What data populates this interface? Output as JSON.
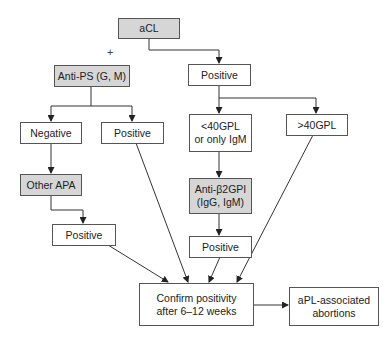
{
  "diagram": {
    "type": "flowchart",
    "nodes": [
      {
        "id": "acl",
        "label": "aCL",
        "shaded": true
      },
      {
        "id": "anti_ps",
        "label": "Anti-PS (G, M)",
        "shaded": true
      },
      {
        "id": "acl_positive",
        "label": "Positive",
        "shaded": false
      },
      {
        "id": "ps_negative",
        "label": "Negative",
        "shaded": false
      },
      {
        "id": "ps_positive",
        "label": "Positive",
        "shaded": false
      },
      {
        "id": "lt40",
        "label": "<40GPL\nor only IgM",
        "shaded": false
      },
      {
        "id": "gt40",
        "label": ">40GPL",
        "shaded": false
      },
      {
        "id": "other_apa",
        "label": "Other APA",
        "shaded": true
      },
      {
        "id": "anti_b2gpi",
        "label": "Anti-β2GPI\n(IgG, IgM)",
        "shaded": true
      },
      {
        "id": "apa_positive",
        "label": "Positive",
        "shaded": false
      },
      {
        "id": "b2gpi_positive",
        "label": "Positive",
        "shaded": false
      },
      {
        "id": "confirm",
        "label": "Confirm positivity\nafter 6–12 weeks",
        "shaded": false
      },
      {
        "id": "apl_abortions",
        "label": "aPL-associated\nabortions",
        "shaded": false
      }
    ],
    "plus_symbol": "+",
    "edges": [
      [
        "acl",
        "acl_positive"
      ],
      [
        "anti_ps",
        "ps_negative"
      ],
      [
        "anti_ps",
        "ps_positive"
      ],
      [
        "acl_positive",
        "lt40"
      ],
      [
        "acl_positive",
        "gt40"
      ],
      [
        "ps_negative",
        "other_apa"
      ],
      [
        "other_apa",
        "apa_positive"
      ],
      [
        "lt40",
        "anti_b2gpi"
      ],
      [
        "anti_b2gpi",
        "b2gpi_positive"
      ],
      [
        "apa_positive",
        "confirm"
      ],
      [
        "ps_positive",
        "confirm"
      ],
      [
        "b2gpi_positive",
        "confirm"
      ],
      [
        "gt40",
        "confirm"
      ],
      [
        "confirm",
        "apl_abortions"
      ]
    ],
    "colors": {
      "shaded_fill": "#d6d6d6",
      "border": "#555555",
      "line": "#333333"
    }
  }
}
